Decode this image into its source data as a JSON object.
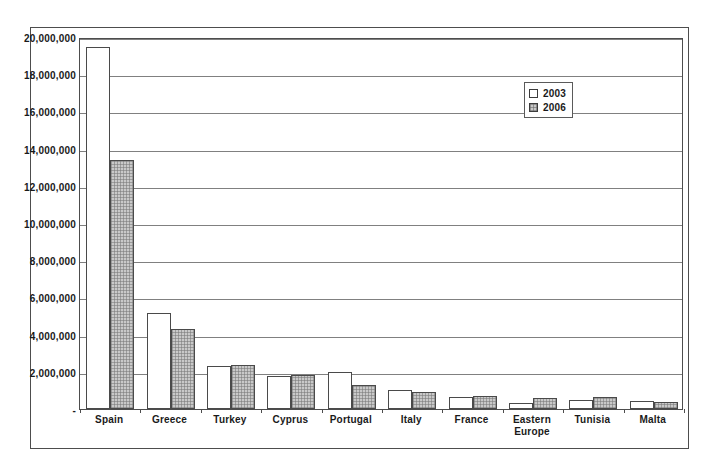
{
  "chart_data": {
    "type": "bar",
    "title": "",
    "xlabel": "",
    "ylabel": "",
    "ylim": [
      0,
      20000000
    ],
    "ytick_step": 2000000,
    "grid": true,
    "legend_position": "upper-right",
    "zero_tick_label": "-",
    "categories": [
      "Spain",
      "Greece",
      "Turkey",
      "Cyprus",
      "Portugal",
      "Italy",
      "France",
      "Eastern\nEurope",
      "Tunisia",
      "Malta"
    ],
    "category_labels": [
      "Spain",
      "Greece",
      "Turkey",
      "Cyprus",
      "Portugal",
      "Italy",
      "France",
      "Eastern Europe",
      "Tunisia",
      "Malta"
    ],
    "tick_labels": [
      "20,000,000",
      "18,000,000",
      "16,000,000",
      "14,000,000",
      "12,000,000",
      "10,000,000",
      "8,000,000",
      "6,000,000",
      "4,000,000",
      "2,000,000",
      "-"
    ],
    "series": [
      {
        "name": "2003",
        "color": "#ffffff",
        "values": [
          19450000,
          5150000,
          2300000,
          1750000,
          2000000,
          1000000,
          650000,
          300000,
          500000,
          450000
        ]
      },
      {
        "name": "2006",
        "color": "#c9c9c9",
        "values": [
          13400000,
          4300000,
          2380000,
          1830000,
          1300000,
          900000,
          700000,
          600000,
          650000,
          400000
        ]
      }
    ]
  },
  "legend": {
    "items": [
      {
        "label": "2003",
        "swatch": "empty-square-icon"
      },
      {
        "label": "2006",
        "swatch": "hatched-square-icon"
      }
    ]
  },
  "colors": {
    "border": "#4d4d4d",
    "gridline": "#808080",
    "series_2003": "#ffffff",
    "series_2006": "#c9c9c9",
    "text": "#1a1a1a",
    "background": "#ffffff"
  }
}
